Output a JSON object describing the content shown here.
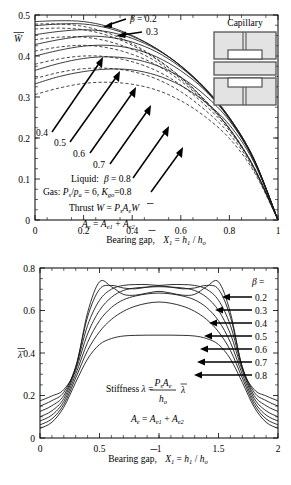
{
  "figure": {
    "inset_title": "Capillary"
  },
  "chart_data": [
    {
      "type": "line",
      "id": "thrust",
      "title": "",
      "ylabel": "W̄",
      "xlabel": "Bearing gap,  X̄₁ = h₁ / hₒ",
      "xlim": [
        0,
        1
      ],
      "ylim": [
        0,
        0.5
      ],
      "xticks": [
        "0",
        "0.2",
        "0.4",
        "0.6",
        "0.8",
        "1"
      ],
      "xtick_values": [
        0,
        0.2,
        0.4,
        0.6,
        0.8,
        1
      ],
      "yticks": [
        "0",
        "0.1",
        "0.2",
        "0.3",
        "0.4",
        "0.5"
      ],
      "ytick_values": [
        0,
        0.1,
        0.2,
        0.3,
        0.4,
        0.5
      ],
      "grid": false,
      "legend_position": "inline-annotations",
      "annotations": [
        {
          "text": "β = 0.2",
          "x": 0.44,
          "y": 0.487
        },
        {
          "text": "0.3",
          "x": 0.51,
          "y": 0.458
        },
        {
          "text": "0.4",
          "x": 0.055,
          "y": 0.283
        },
        {
          "text": "0.5",
          "x": 0.135,
          "y": 0.262
        },
        {
          "text": "0.6",
          "x": 0.215,
          "y": 0.237
        },
        {
          "text": "0.7",
          "x": 0.3,
          "y": 0.21
        },
        {
          "text": "Liquid:   β = 0.8",
          "x": 0.225,
          "y": 0.178
        },
        {
          "text": "Gas: Pₛ/pₐ = 6, K₉ₒ=0.8",
          "x": 0.1,
          "y": 0.148
        },
        {
          "text": "Thrust  W = Pₛ Aₑ W̄",
          "x": 0.215,
          "y": 0.108
        },
        {
          "text": "Aₑ = Aₑ₁ + Aₑ₂",
          "x": 0.275,
          "y": 0.062
        }
      ],
      "series": [
        {
          "name": "β = 0.2 liquid",
          "style": "solid",
          "y0": 0.484,
          "x": [
            0,
            0.1,
            0.2,
            0.3,
            0.4,
            0.5,
            0.6,
            0.7,
            0.8,
            0.9,
            1.0
          ],
          "values": [
            0.484,
            0.486,
            0.484,
            0.472,
            0.45,
            0.418,
            0.375,
            0.318,
            0.246,
            0.146,
            0.0
          ]
        },
        {
          "name": "β = 0.3 liquid",
          "style": "solid",
          "y0": 0.474,
          "x": [
            0,
            0.1,
            0.2,
            0.3,
            0.4,
            0.5,
            0.6,
            0.7,
            0.8,
            0.9,
            1.0
          ],
          "values": [
            0.474,
            0.478,
            0.478,
            0.468,
            0.448,
            0.418,
            0.376,
            0.32,
            0.248,
            0.148,
            0.0
          ]
        },
        {
          "name": "β = 0.4 liquid",
          "style": "solid",
          "y0": 0.452,
          "x": [
            0,
            0.1,
            0.2,
            0.3,
            0.4,
            0.5,
            0.6,
            0.7,
            0.8,
            0.9,
            1.0
          ],
          "values": [
            0.452,
            0.46,
            0.464,
            0.459,
            0.443,
            0.416,
            0.376,
            0.322,
            0.25,
            0.15,
            0.0
          ]
        },
        {
          "name": "β = 0.5 liquid",
          "style": "solid",
          "y0": 0.428,
          "x": [
            0,
            0.1,
            0.2,
            0.3,
            0.4,
            0.5,
            0.6,
            0.7,
            0.8,
            0.9,
            1.0
          ],
          "values": [
            0.428,
            0.44,
            0.448,
            0.446,
            0.434,
            0.41,
            0.372,
            0.32,
            0.25,
            0.15,
            0.0
          ]
        },
        {
          "name": "β = 0.6 liquid",
          "style": "solid",
          "y0": 0.4,
          "x": [
            0,
            0.1,
            0.2,
            0.3,
            0.4,
            0.5,
            0.6,
            0.7,
            0.8,
            0.9,
            1.0
          ],
          "values": [
            0.4,
            0.414,
            0.424,
            0.426,
            0.418,
            0.398,
            0.364,
            0.316,
            0.248,
            0.15,
            0.0
          ]
        },
        {
          "name": "β = 0.7 liquid",
          "style": "solid",
          "y0": 0.365,
          "x": [
            0,
            0.1,
            0.2,
            0.3,
            0.4,
            0.5,
            0.6,
            0.7,
            0.8,
            0.9,
            1.0
          ],
          "values": [
            0.365,
            0.382,
            0.394,
            0.398,
            0.393,
            0.377,
            0.348,
            0.304,
            0.242,
            0.147,
            0.0
          ]
        },
        {
          "name": "β = 0.8 liquid",
          "style": "solid",
          "y0": 0.332,
          "x": [
            0,
            0.1,
            0.2,
            0.3,
            0.4,
            0.5,
            0.6,
            0.7,
            0.8,
            0.9,
            1.0
          ],
          "values": [
            0.332,
            0.35,
            0.362,
            0.368,
            0.366,
            0.353,
            0.328,
            0.288,
            0.232,
            0.142,
            0.0
          ]
        },
        {
          "name": "β = 0.2 gas",
          "style": "dashed",
          "y0": 0.478,
          "x": [
            0,
            0.1,
            0.2,
            0.3,
            0.4,
            0.5,
            0.6,
            0.7,
            0.8,
            0.9,
            1.0
          ],
          "values": [
            0.478,
            0.478,
            0.472,
            0.456,
            0.43,
            0.394,
            0.348,
            0.292,
            0.222,
            0.128,
            0.0
          ]
        },
        {
          "name": "β = 0.3 gas",
          "style": "dashed",
          "y0": 0.466,
          "x": [
            0,
            0.1,
            0.2,
            0.3,
            0.4,
            0.5,
            0.6,
            0.7,
            0.8,
            0.9,
            1.0
          ],
          "values": [
            0.466,
            0.468,
            0.464,
            0.45,
            0.426,
            0.392,
            0.348,
            0.292,
            0.224,
            0.13,
            0.0
          ]
        },
        {
          "name": "β = 0.4 gas",
          "style": "dashed",
          "y0": 0.44,
          "x": [
            0,
            0.1,
            0.2,
            0.3,
            0.4,
            0.5,
            0.6,
            0.7,
            0.8,
            0.9,
            1.0
          ],
          "values": [
            0.44,
            0.446,
            0.446,
            0.436,
            0.416,
            0.386,
            0.344,
            0.29,
            0.223,
            0.13,
            0.0
          ]
        },
        {
          "name": "β = 0.5 gas",
          "style": "dashed",
          "y0": 0.412,
          "x": [
            0,
            0.1,
            0.2,
            0.3,
            0.4,
            0.5,
            0.6,
            0.7,
            0.8,
            0.9,
            1.0
          ],
          "values": [
            0.412,
            0.422,
            0.426,
            0.42,
            0.404,
            0.378,
            0.339,
            0.287,
            0.222,
            0.13,
            0.0
          ]
        },
        {
          "name": "β = 0.6 gas",
          "style": "dashed",
          "y0": 0.38,
          "x": [
            0,
            0.1,
            0.2,
            0.3,
            0.4,
            0.5,
            0.6,
            0.7,
            0.8,
            0.9,
            1.0
          ],
          "values": [
            0.38,
            0.393,
            0.4,
            0.398,
            0.386,
            0.364,
            0.329,
            0.28,
            0.218,
            0.128,
            0.0
          ]
        },
        {
          "name": "β = 0.7 gas",
          "style": "dashed",
          "y0": 0.345,
          "x": [
            0,
            0.1,
            0.2,
            0.3,
            0.4,
            0.5,
            0.6,
            0.7,
            0.8,
            0.9,
            1.0
          ],
          "values": [
            0.345,
            0.36,
            0.369,
            0.37,
            0.362,
            0.344,
            0.313,
            0.268,
            0.21,
            0.124,
            0.0
          ]
        },
        {
          "name": "β = 0.8 gas",
          "style": "dashed",
          "y0": 0.306,
          "x": [
            0,
            0.1,
            0.2,
            0.3,
            0.4,
            0.5,
            0.6,
            0.7,
            0.8,
            0.9,
            1.0
          ],
          "values": [
            0.306,
            0.322,
            0.333,
            0.336,
            0.331,
            0.317,
            0.291,
            0.252,
            0.199,
            0.119,
            0.0
          ]
        }
      ]
    },
    {
      "type": "line",
      "id": "stiffness",
      "title": "",
      "ylabel": "λ̄",
      "xlabel": "Bearing gap,  X̄₁ = h₁ / hₒ",
      "xlim": [
        0,
        2
      ],
      "ylim": [
        0,
        0.8
      ],
      "xticks": [
        "0",
        "0.5",
        "1",
        "1.5",
        "2"
      ],
      "xtick_values": [
        0,
        0.5,
        1,
        1.5,
        2
      ],
      "yticks": [
        "0",
        "0.2",
        "0.4",
        "0.6",
        "0.8"
      ],
      "ytick_values": [
        0,
        0.2,
        0.4,
        0.6,
        0.8
      ],
      "grid": false,
      "legend_position": "right",
      "legend_title": "β =",
      "legend_entries": [
        "0.2",
        "0.3",
        "0.4",
        "0.5",
        "0.6",
        "0.7",
        "0.8"
      ],
      "annotations": [
        {
          "text": "Stiffness  λ =",
          "x": 0.62,
          "y": 0.245
        },
        {
          "text": "Pₛ Aₑ",
          "x": 1.03,
          "y": 0.285
        },
        {
          "text": "hₒ",
          "x": 1.03,
          "y": 0.205
        },
        {
          "text": "λ̄",
          "x": 1.2,
          "y": 0.245
        },
        {
          "text": "Aₑ = Aₑ₁ + Aₑ₂",
          "x": 0.8,
          "y": 0.135
        }
      ],
      "series": [
        {
          "name": "β = 0.2",
          "x": [
            0,
            0.1,
            0.2,
            0.3,
            0.4,
            0.5,
            0.6,
            0.7,
            0.8,
            0.9,
            1.0,
            1.1,
            1.2,
            1.3,
            1.4,
            1.5,
            1.6,
            1.7,
            1.8,
            1.9,
            2.0
          ],
          "values": [
            0.175,
            0.198,
            0.228,
            0.33,
            0.59,
            0.735,
            0.712,
            0.676,
            0.672,
            0.682,
            0.69,
            0.682,
            0.672,
            0.676,
            0.712,
            0.735,
            0.59,
            0.33,
            0.228,
            0.198,
            0.175
          ]
        },
        {
          "name": "β = 0.3",
          "x": [
            0,
            0.1,
            0.2,
            0.3,
            0.4,
            0.5,
            0.6,
            0.7,
            0.8,
            0.9,
            1.0,
            1.1,
            1.2,
            1.3,
            1.4,
            1.5,
            1.6,
            1.7,
            1.8,
            1.9,
            2.0
          ],
          "values": [
            0.15,
            0.176,
            0.215,
            0.336,
            0.57,
            0.7,
            0.718,
            0.706,
            0.702,
            0.71,
            0.716,
            0.71,
            0.702,
            0.706,
            0.718,
            0.7,
            0.57,
            0.336,
            0.215,
            0.176,
            0.15
          ]
        },
        {
          "name": "β = 0.4",
          "x": [
            0,
            0.1,
            0.2,
            0.3,
            0.4,
            0.5,
            0.6,
            0.7,
            0.8,
            0.9,
            1.0,
            1.1,
            1.2,
            1.3,
            1.4,
            1.5,
            1.6,
            1.7,
            1.8,
            1.9,
            2.0
          ],
          "values": [
            0.125,
            0.152,
            0.2,
            0.33,
            0.53,
            0.648,
            0.7,
            0.718,
            0.722,
            0.722,
            0.718,
            0.722,
            0.722,
            0.718,
            0.7,
            0.648,
            0.53,
            0.33,
            0.2,
            0.152,
            0.125
          ]
        },
        {
          "name": "β = 0.5",
          "x": [
            0,
            0.1,
            0.2,
            0.3,
            0.4,
            0.5,
            0.6,
            0.7,
            0.8,
            0.9,
            1.0,
            1.1,
            1.2,
            1.3,
            1.4,
            1.5,
            1.6,
            1.7,
            1.8,
            1.9,
            2.0
          ],
          "values": [
            0.1,
            0.128,
            0.186,
            0.318,
            0.49,
            0.6,
            0.662,
            0.694,
            0.706,
            0.71,
            0.712,
            0.71,
            0.706,
            0.694,
            0.662,
            0.6,
            0.49,
            0.318,
            0.186,
            0.128,
            0.1
          ]
        },
        {
          "name": "β = 0.6",
          "x": [
            0,
            0.1,
            0.2,
            0.3,
            0.4,
            0.5,
            0.6,
            0.7,
            0.8,
            0.9,
            1.0,
            1.1,
            1.2,
            1.3,
            1.4,
            1.5,
            1.6,
            1.7,
            1.8,
            1.9,
            2.0
          ],
          "values": [
            0.08,
            0.108,
            0.172,
            0.3,
            0.45,
            0.552,
            0.614,
            0.65,
            0.668,
            0.678,
            0.682,
            0.678,
            0.668,
            0.65,
            0.614,
            0.552,
            0.45,
            0.3,
            0.172,
            0.108,
            0.08
          ]
        },
        {
          "name": "β = 0.7",
          "x": [
            0,
            0.1,
            0.2,
            0.3,
            0.4,
            0.5,
            0.6,
            0.7,
            0.8,
            0.9,
            1.0,
            1.1,
            1.2,
            1.3,
            1.4,
            1.5,
            1.6,
            1.7,
            1.8,
            1.9,
            2.0
          ],
          "values": [
            0.062,
            0.09,
            0.158,
            0.282,
            0.412,
            0.5,
            0.558,
            0.596,
            0.62,
            0.634,
            0.64,
            0.634,
            0.62,
            0.596,
            0.558,
            0.5,
            0.412,
            0.282,
            0.158,
            0.09,
            0.062
          ]
        },
        {
          "name": "β = 0.8",
          "x": [
            0,
            0.1,
            0.2,
            0.3,
            0.4,
            0.5,
            0.6,
            0.7,
            0.8,
            0.9,
            1.0,
            1.1,
            1.2,
            1.3,
            1.4,
            1.5,
            1.6,
            1.7,
            1.8,
            1.9,
            2.0
          ],
          "values": [
            0.045,
            0.074,
            0.145,
            0.262,
            0.372,
            0.44,
            0.468,
            0.48,
            0.483,
            0.484,
            0.484,
            0.484,
            0.483,
            0.48,
            0.468,
            0.44,
            0.372,
            0.262,
            0.145,
            0.074,
            0.045
          ]
        }
      ]
    }
  ]
}
